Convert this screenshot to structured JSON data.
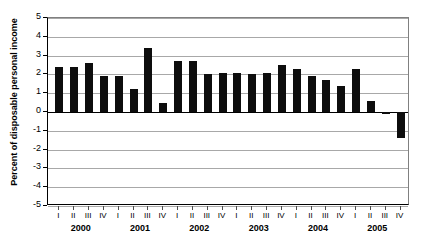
{
  "chart_data": {
    "type": "bar",
    "title": "",
    "xlabel": "",
    "ylabel": "Percent of disposable personal income",
    "ylim": [
      -5,
      5
    ],
    "ytick_values": [
      5,
      4,
      3,
      2,
      1,
      0,
      -1,
      -2,
      -3,
      -4,
      -5
    ],
    "ytick_labels": [
      "5",
      "4",
      "3",
      "2",
      "1",
      "0",
      "-1",
      "-2",
      "-3",
      "-4",
      "-5"
    ],
    "grid": true,
    "legend": "none",
    "years": [
      "2000",
      "2001",
      "2002",
      "2003",
      "2004",
      "2005"
    ],
    "quarters": [
      "I",
      "II",
      "III",
      "IV"
    ],
    "categories": [
      "2000 I",
      "2000 II",
      "2000 III",
      "2000 IV",
      "2001 I",
      "2001 II",
      "2001 III",
      "2001 IV",
      "2002 I",
      "2002 II",
      "2002 III",
      "2002 IV",
      "2003 I",
      "2003 II",
      "2003 III",
      "2003 IV",
      "2004 I",
      "2004 II",
      "2004 III",
      "2004 IV",
      "2005 I",
      "2005 II",
      "2005 III",
      "2005 IV"
    ],
    "values": [
      2.4,
      2.4,
      2.6,
      1.9,
      1.9,
      1.2,
      3.4,
      0.5,
      2.7,
      2.7,
      2.0,
      2.1,
      2.1,
      2.0,
      2.1,
      2.5,
      2.3,
      1.9,
      1.7,
      1.4,
      2.3,
      0.6,
      -0.1,
      -1.4
    ],
    "values_tail": [
      -0.1
    ],
    "bar_color": "#0d0d0d",
    "grid_color": "#a8a8a8",
    "axis_color": "#000000"
  }
}
